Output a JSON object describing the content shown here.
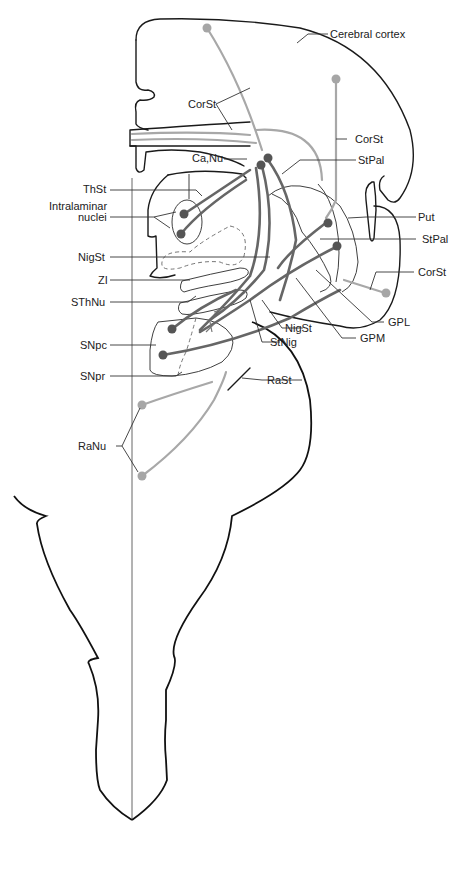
{
  "figure": {
    "type": "neuroanatomy-diagram"
  },
  "colors": {
    "outline": "#1a1a1a",
    "dark_fibers": "#666666",
    "light_fibers": "#a8a8a8",
    "dark_neurons": "#555555",
    "light_neurons": "#a6a6a6",
    "background": "#ffffff"
  },
  "labels": {
    "cerebral_cortex": "Cerebral cortex",
    "corst_left": "CorSt",
    "corst_right_upper": "CorSt",
    "ca_nu": "Ca,Nu",
    "stpal_upper": "StPal",
    "thst": "ThSt",
    "intralaminar_line1": "Intralaminar",
    "intralaminar_line2": "nuclei",
    "put": "Put",
    "stpal_lower": "StPal",
    "nigst_left": "NigSt",
    "zi": "ZI",
    "corst_right_lower": "CorSt",
    "sthnu": "SThNu",
    "gpl": "GPL",
    "snpc": "SNpc",
    "nigst_lower": "NigSt",
    "gpm": "GPM",
    "stnig": "StNig",
    "snpr": "SNpr",
    "rast": "RaSt",
    "ranu": "RaNu"
  },
  "neurons": {
    "dark": [
      "Ca,Nu (2)",
      "Intralaminar nuclei (2)",
      "Put (1)",
      "StPal (1)",
      "SNpc (2)"
    ],
    "light": [
      "Cerebral cortex (2)",
      "CorSt lateral (1)",
      "RaNu (2)"
    ]
  }
}
